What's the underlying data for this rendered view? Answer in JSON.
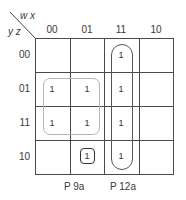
{
  "kmap": {
    "col_var": "w x",
    "row_var": "y z",
    "col_labels": [
      "00",
      "01",
      "11",
      "10"
    ],
    "row_labels": [
      "00",
      "01",
      "11",
      "10"
    ],
    "cells": [
      [
        "",
        "",
        "1",
        ""
      ],
      [
        "1",
        "1",
        "1",
        ""
      ],
      [
        "1",
        "1",
        "1",
        ""
      ],
      [
        "",
        "1",
        "1",
        ""
      ]
    ],
    "groups": [
      {
        "name": "square-group",
        "cells": "rows 01-11, cols 00-01",
        "color": "#b0b0b0"
      },
      {
        "name": "column-group",
        "cells": "col 11, all rows",
        "color": "#555555"
      },
      {
        "name": "single-group",
        "cells": "row 10, col 01",
        "color": "#333333"
      }
    ]
  },
  "captions": {
    "left": "P 9a",
    "right": "P 12a"
  }
}
